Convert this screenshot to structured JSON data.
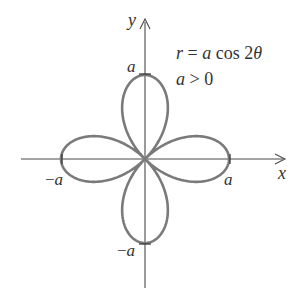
{
  "figure": {
    "equation": {
      "r": "r",
      "eq": " = ",
      "a": "a",
      "cos": " cos 2",
      "theta": "θ"
    },
    "condition": {
      "a": "a",
      "rest": " > 0"
    },
    "axes": {
      "x_label": "x",
      "y_label": "y"
    },
    "tick_labels": {
      "x_pos": "a",
      "x_neg_sign": "−",
      "x_neg": "a",
      "y_pos": "a",
      "y_neg_sign": "−",
      "y_neg": "a"
    },
    "colors": {
      "curve": "#7a7a7a",
      "axes": "#4a4a4a",
      "text": "#333333"
    }
  },
  "chart_data": {
    "type": "polar-curve",
    "equation": "r = a cos 2θ",
    "condition": "a > 0",
    "curve": "four-petaled rose",
    "petals": 4,
    "petal_tips": [
      {
        "label": "a",
        "x": 1,
        "y": 0
      },
      {
        "label": "-a",
        "x": -1,
        "y": 0
      },
      {
        "label": "a",
        "x": 0,
        "y": 1
      },
      {
        "label": "-a",
        "x": 0,
        "y": -1
      }
    ],
    "xlabel": "x",
    "ylabel": "y",
    "xlim": [
      -1.45,
      1.65
    ],
    "ylim": [
      -1.5,
      1.65
    ],
    "grid": false
  }
}
